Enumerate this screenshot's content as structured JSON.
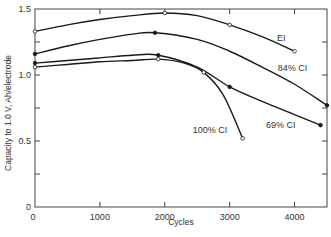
{
  "chart_data": {
    "type": "line",
    "title": "",
    "xlabel": "Cycles",
    "ylabel": "Capacity to 1.0 V, Ah/electrode",
    "xlim": [
      0,
      4500
    ],
    "ylim": [
      0,
      1.5
    ],
    "x_ticks": [
      0,
      1000,
      2000,
      3000,
      4000
    ],
    "x_tick_labels": [
      "0",
      "1000",
      "2000",
      "3000",
      "4000"
    ],
    "y_ticks": [
      0,
      0.25,
      0.5,
      0.75,
      1.0,
      1.25,
      1.5
    ],
    "y_tick_labels": [
      "0",
      "",
      "0.5",
      "",
      "1.0",
      "",
      "1.5"
    ],
    "grid": false,
    "legend": "inline labels",
    "series": [
      {
        "name": "EI",
        "marker": "open-circle",
        "points": [
          [
            0,
            1.33
          ],
          [
            500,
            1.38
          ],
          [
            1000,
            1.42
          ],
          [
            1500,
            1.45
          ],
          [
            2000,
            1.47
          ],
          [
            2500,
            1.45
          ],
          [
            3000,
            1.38
          ],
          [
            3500,
            1.29
          ],
          [
            4000,
            1.18
          ]
        ],
        "marked": [
          [
            0,
            1.33
          ],
          [
            2000,
            1.47
          ],
          [
            3000,
            1.38
          ],
          [
            4000,
            1.18
          ]
        ]
      },
      {
        "name": "84% CI",
        "marker": "filled-circle",
        "points": [
          [
            0,
            1.16
          ],
          [
            500,
            1.22
          ],
          [
            1000,
            1.27
          ],
          [
            1500,
            1.31
          ],
          [
            1850,
            1.32
          ],
          [
            2500,
            1.27
          ],
          [
            3000,
            1.18
          ],
          [
            3500,
            1.06
          ],
          [
            4000,
            0.93
          ],
          [
            4500,
            0.77
          ]
        ],
        "marked": [
          [
            0,
            1.16
          ],
          [
            1850,
            1.32
          ],
          [
            4500,
            0.77
          ]
        ]
      },
      {
        "name": "69% CI",
        "marker": "filled-circle",
        "points": [
          [
            0,
            1.09
          ],
          [
            500,
            1.11
          ],
          [
            1000,
            1.13
          ],
          [
            1500,
            1.15
          ],
          [
            1900,
            1.15
          ],
          [
            2500,
            1.06
          ],
          [
            3000,
            0.91
          ],
          [
            3500,
            0.8
          ],
          [
            4000,
            0.7
          ],
          [
            4400,
            0.62
          ]
        ],
        "marked": [
          [
            0,
            1.09
          ],
          [
            1900,
            1.15
          ],
          [
            3000,
            0.91
          ],
          [
            4400,
            0.62
          ]
        ]
      },
      {
        "name": "100% CI",
        "marker": "open-circle",
        "points": [
          [
            0,
            1.06
          ],
          [
            500,
            1.08
          ],
          [
            1000,
            1.1
          ],
          [
            1500,
            1.11
          ],
          [
            1900,
            1.12
          ],
          [
            2300,
            1.09
          ],
          [
            2600,
            1.02
          ],
          [
            2900,
            0.85
          ],
          [
            3200,
            0.52
          ]
        ],
        "marked": [
          [
            0,
            1.06
          ],
          [
            1900,
            1.12
          ],
          [
            2600,
            1.02
          ],
          [
            3200,
            0.52
          ]
        ]
      }
    ],
    "annotations": [
      {
        "text": "EI",
        "x": 3730,
        "y": 1.26
      },
      {
        "text": "84% CI",
        "x": 3740,
        "y": 1.03
      },
      {
        "text": "69% CI",
        "x": 3560,
        "y": 0.6
      },
      {
        "text": "100% CI",
        "x": 2430,
        "y": 0.56
      }
    ]
  }
}
